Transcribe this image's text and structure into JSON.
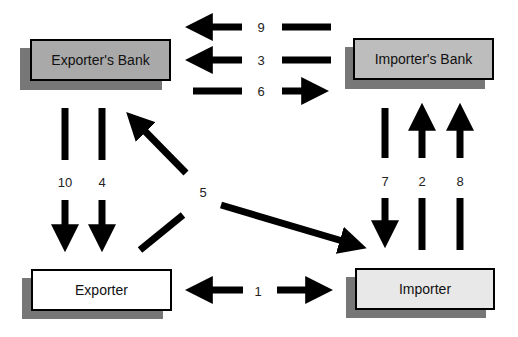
{
  "nodes": {
    "exporters_bank": {
      "label": "Exporter's Bank",
      "fill": "#a9a9a9"
    },
    "importers_bank": {
      "label": "Importer's Bank",
      "fill": "#bdbdbd"
    },
    "exporter": {
      "label": "Exporter",
      "fill": "#ffffff"
    },
    "importer": {
      "label": "Importer",
      "fill": "#e8e8e8"
    }
  },
  "shadow_color": "#777777",
  "steps": {
    "s1": "1",
    "s2": "2",
    "s3": "3",
    "s4": "4",
    "s5": "5",
    "s6": "6",
    "s7": "7",
    "s8": "8",
    "s9": "9",
    "s10": "10"
  },
  "edges": [
    {
      "step": "1",
      "from": "Exporter",
      "to": "Importer",
      "direction": "bidirectional"
    },
    {
      "step": "2",
      "from": "Importer",
      "to": "Importer's Bank"
    },
    {
      "step": "3",
      "from": "Importer's Bank",
      "to": "Exporter's Bank"
    },
    {
      "step": "4",
      "from": "Exporter's Bank",
      "to": "Exporter"
    },
    {
      "step": "5",
      "from": "Exporter",
      "to": [
        "Exporter's Bank",
        "Importer"
      ]
    },
    {
      "step": "6",
      "from": "Exporter's Bank",
      "to": "Importer's Bank"
    },
    {
      "step": "7",
      "from": "Importer's Bank",
      "to": "Importer"
    },
    {
      "step": "8",
      "from": "Importer",
      "to": "Importer's Bank"
    },
    {
      "step": "9",
      "from": "Importer's Bank",
      "to": "Exporter's Bank"
    },
    {
      "step": "10",
      "from": "Exporter's Bank",
      "to": "Exporter"
    }
  ]
}
